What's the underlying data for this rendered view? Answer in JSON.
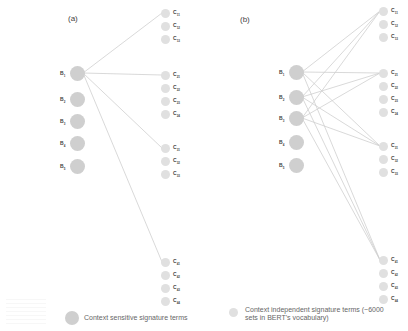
{
  "panels": [
    {
      "id": "a",
      "label": "(a)",
      "b_nodes": [
        {
          "main": "B",
          "sub": "1"
        },
        {
          "main": "B",
          "sub": "2"
        },
        {
          "main": "B",
          "sub": "3"
        },
        {
          "main": "B",
          "sub": "4"
        },
        {
          "main": "B",
          "sub": "5"
        }
      ],
      "c_groups": [
        [
          {
            "main": "C",
            "sub": "11"
          },
          {
            "main": "C",
            "sub": "12"
          },
          {
            "main": "C",
            "sub": "13"
          }
        ],
        [
          {
            "main": "C",
            "sub": "21"
          },
          {
            "main": "C",
            "sub": "22"
          },
          {
            "main": "C",
            "sub": "23"
          },
          {
            "main": "C",
            "sub": "24"
          }
        ],
        [
          {
            "main": "C",
            "sub": "31"
          },
          {
            "main": "C",
            "sub": "32"
          },
          {
            "main": "C",
            "sub": "33"
          }
        ],
        [
          {
            "main": "C",
            "sub": "41"
          },
          {
            "main": "C",
            "sub": "42"
          },
          {
            "main": "C",
            "sub": "43"
          },
          {
            "main": "C",
            "sub": "44"
          }
        ]
      ],
      "edges": [
        [
          "B1",
          "C11"
        ],
        [
          "B1",
          "C21"
        ],
        [
          "B1",
          "C31"
        ],
        [
          "B1",
          "C41"
        ]
      ]
    },
    {
      "id": "b",
      "label": "(b)",
      "b_nodes": [
        {
          "main": "B",
          "sub": "1"
        },
        {
          "main": "B",
          "sub": "2"
        },
        {
          "main": "B",
          "sub": "3"
        },
        {
          "main": "B",
          "sub": "4"
        },
        {
          "main": "B",
          "sub": "5"
        }
      ],
      "c_groups": [
        [
          {
            "main": "C",
            "sub": "11"
          },
          {
            "main": "C",
            "sub": "12"
          },
          {
            "main": "C",
            "sub": "13"
          }
        ],
        [
          {
            "main": "C",
            "sub": "21"
          },
          {
            "main": "C",
            "sub": "22"
          },
          {
            "main": "C",
            "sub": "23"
          },
          {
            "main": "C",
            "sub": "24"
          }
        ],
        [
          {
            "main": "C",
            "sub": "31"
          },
          {
            "main": "C",
            "sub": "32"
          },
          {
            "main": "C",
            "sub": "33"
          }
        ],
        [
          {
            "main": "C",
            "sub": "41"
          },
          {
            "main": "C",
            "sub": "42"
          },
          {
            "main": "C",
            "sub": "43"
          },
          {
            "main": "C",
            "sub": "44"
          }
        ]
      ],
      "edges": [
        [
          "B1",
          "C11"
        ],
        [
          "B1",
          "C21"
        ],
        [
          "B1",
          "C31"
        ],
        [
          "B1",
          "C41"
        ],
        [
          "B2",
          "C11"
        ],
        [
          "B2",
          "C21"
        ],
        [
          "B2",
          "C31"
        ],
        [
          "B2",
          "C41"
        ],
        [
          "B3",
          "C11"
        ],
        [
          "B3",
          "C21"
        ],
        [
          "B3",
          "C31"
        ],
        [
          "B3",
          "C41"
        ]
      ]
    }
  ],
  "legend": {
    "context_sensitive": "Context sensitive signature terms",
    "context_independent_line1": "Context independent signature terms (~6000",
    "context_independent_line2": "sets in BERT's vocabulary)"
  },
  "colors": {
    "b_node": "#cfcfcf",
    "c_node": "#e0e0e0",
    "edge": "#cfcfcf"
  }
}
